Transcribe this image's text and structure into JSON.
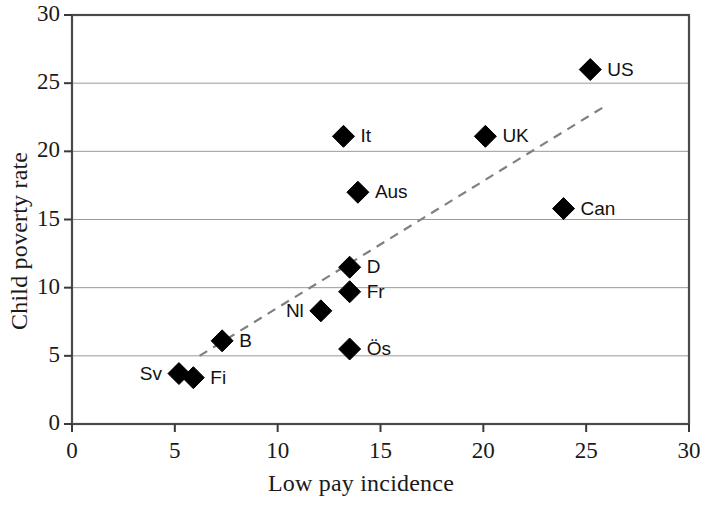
{
  "chart_data": {
    "type": "scatter",
    "title": "",
    "xlabel": "Low pay incidence",
    "ylabel": "Child poverty rate",
    "xlim": [
      0,
      30
    ],
    "ylim": [
      0,
      30
    ],
    "xticks": [
      0,
      5,
      10,
      15,
      20,
      25,
      30
    ],
    "yticks": [
      0,
      5,
      10,
      15,
      20,
      25,
      30
    ],
    "xtick_labels": [
      "0",
      "5",
      "10",
      "15",
      "20",
      "25",
      "30"
    ],
    "ytick_labels": [
      "0",
      "5",
      "10",
      "15",
      "20",
      "25",
      "30"
    ],
    "grid": "horizontal",
    "legend": "none",
    "marker": "filled-diamond",
    "marker_color": "#000000",
    "points": [
      {
        "label": "US",
        "x": 25.2,
        "y": 26.0,
        "label_pos": "right"
      },
      {
        "label": "UK",
        "x": 20.1,
        "y": 21.1,
        "label_pos": "right"
      },
      {
        "label": "It",
        "x": 13.2,
        "y": 21.1,
        "label_pos": "right"
      },
      {
        "label": "Can",
        "x": 23.9,
        "y": 15.8,
        "label_pos": "right"
      },
      {
        "label": "Aus",
        "x": 13.9,
        "y": 17.0,
        "label_pos": "right"
      },
      {
        "label": "D",
        "x": 13.5,
        "y": 11.5,
        "label_pos": "right"
      },
      {
        "label": "Fr",
        "x": 13.5,
        "y": 9.7,
        "label_pos": "right"
      },
      {
        "label": "Nl",
        "x": 12.1,
        "y": 8.3,
        "label_pos": "left"
      },
      {
        "label": "Ös",
        "x": 13.5,
        "y": 5.5,
        "label_pos": "right"
      },
      {
        "label": "B",
        "x": 7.3,
        "y": 6.1,
        "label_pos": "right"
      },
      {
        "label": "Sv",
        "x": 5.2,
        "y": 3.7,
        "label_pos": "left"
      },
      {
        "label": "Fi",
        "x": 5.9,
        "y": 3.4,
        "label_pos": "right"
      }
    ],
    "trendline": {
      "style": "dashed",
      "color": "#808080",
      "x0": 6.2,
      "y0": 5.0,
      "x1": 25.9,
      "y1": 23.3
    }
  }
}
